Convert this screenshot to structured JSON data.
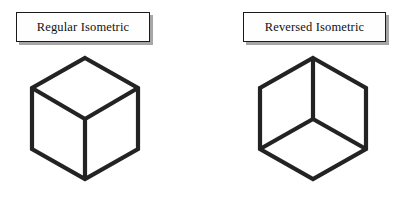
{
  "figure": {
    "background_color": "#ffffff",
    "line_color": "#232323",
    "box_border_color": "#1a1a1a",
    "box_fill_color": "#fefefe",
    "shadow_color": "#969696",
    "panels": [
      {
        "id": "regular",
        "label": "Regular Isometric",
        "cube": {
          "orientation": "regular",
          "description": "Isometric cube viewed from above; interior vertex forms a Y with the stem pointing down",
          "outline_points": "65,10 118,40 118,101 65,131 12,101 12,40",
          "interior_center": "65,71",
          "interior_spokes": [
            "65,71 12,40",
            "65,71 118,40",
            "65,71 65,131"
          ]
        }
      },
      {
        "id": "reversed",
        "label": "Reversed Isometric",
        "cube": {
          "orientation": "reversed",
          "description": "Reversed isometric cube viewed from below; interior vertex forms an inverted Y with the stem pointing up",
          "outline_points": "65,10 118,40 118,101 65,131 12,101 12,40",
          "interior_center": "65,71",
          "interior_spokes": [
            "65,71 12,101",
            "65,71 118,101",
            "65,71 65,10"
          ]
        }
      }
    ]
  }
}
